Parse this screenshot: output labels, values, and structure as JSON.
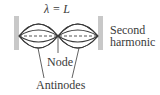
{
  "diagram": {
    "wavelength_label": "λ = L",
    "harmonic_label_line1": "Second",
    "harmonic_label_line2": "harmonic",
    "node_label": "Node",
    "antinodes_label": "Antinodes",
    "colors": {
      "wall": "#c8c8c8",
      "string": "#3a3a3a",
      "dashed": "#555555",
      "text": "#3a3a3a"
    }
  }
}
